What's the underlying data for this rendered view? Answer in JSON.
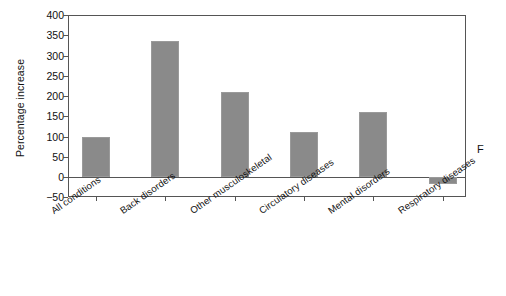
{
  "chart_data": {
    "type": "bar",
    "title": "",
    "subtitle": "",
    "xlabel": "",
    "ylabel": "Percentage increase",
    "categories": [
      "All conditions",
      "Back disorders",
      "Other musculoskeletal",
      "Circulatory diseases",
      "Mental disorders",
      "Respiratory diseases"
    ],
    "values": [
      100,
      335,
      210,
      110,
      160,
      -18
    ],
    "ylim": [
      -50,
      400
    ],
    "ytick_labels": [
      "400",
      "350",
      "300",
      "250",
      "200",
      "150",
      "100",
      "50",
      "0",
      "−50"
    ],
    "ytick_values": [
      400,
      350,
      300,
      250,
      200,
      150,
      100,
      50,
      0,
      -50
    ],
    "grid": false,
    "legend": null,
    "legend_position": "none",
    "bar_color": "#8a8a8a",
    "axis_color": "#555555",
    "background_color": "#ffffff",
    "annotations": [
      {
        "text": "F",
        "position": "right-outside-plot"
      }
    ]
  }
}
